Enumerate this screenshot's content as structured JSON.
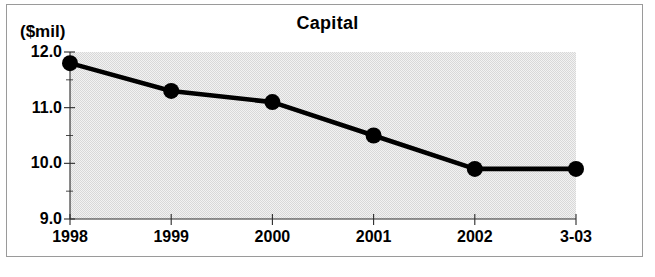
{
  "chart_data": {
    "type": "line",
    "title": "Capital",
    "ylabel": "($mil)",
    "xlabel": "",
    "categories": [
      "1998",
      "1999",
      "2000",
      "2001",
      "2002",
      "3-03"
    ],
    "values": [
      11.8,
      11.3,
      11.1,
      10.5,
      9.9,
      9.9
    ],
    "series": [
      {
        "name": "Capital",
        "values": [
          11.8,
          11.3,
          11.1,
          10.5,
          9.9,
          9.9
        ]
      }
    ],
    "ylim": [
      9.0,
      12.0
    ],
    "ytick_labels": [
      "12.0",
      "11.0",
      "10.0",
      "9.0"
    ],
    "ytick_values": [
      12.0,
      11.0,
      10.0,
      9.0
    ],
    "yminor_values": [
      11.5,
      10.5,
      9.5
    ],
    "grid": false,
    "legend": "none",
    "marker": "filled-circle",
    "line_color": "#000000",
    "plot_background": "#e9e9e9",
    "frame_color": "#9a9a9a"
  },
  "figure": {
    "unit_label": "($mil)",
    "title": "Capital"
  }
}
